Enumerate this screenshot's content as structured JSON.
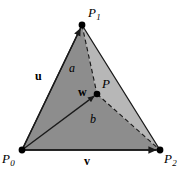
{
  "figure": {
    "background_color": "#ffffff",
    "line_color": "#1a1a1a",
    "fill_dark": "#8c8c8c",
    "fill_light": "#b4b4b4",
    "vertices": {
      "p0": {
        "label": "P",
        "subscript": "0",
        "x": 22,
        "y": 150
      },
      "p1": {
        "label": "P",
        "subscript": "1",
        "x": 82,
        "y": 25
      },
      "p2": {
        "label": "P",
        "subscript": "2",
        "x": 160,
        "y": 150
      },
      "p": {
        "label": "P",
        "x": 97,
        "y": 94
      }
    },
    "vectors": [
      {
        "name": "u",
        "label": "u",
        "from": "p0",
        "to": "p1",
        "style": "solid-arrow"
      },
      {
        "name": "v",
        "label": "v",
        "from": "p0",
        "to": "p2",
        "style": "solid-arrow"
      },
      {
        "name": "w",
        "label": "w",
        "from": "p0",
        "to": "p",
        "style": "solid-arrow"
      }
    ],
    "dashed_segments": [
      {
        "name": "p1-to-p",
        "from": "p1",
        "to": "p"
      },
      {
        "name": "p-to-p2",
        "from": "p",
        "to": "p2"
      }
    ],
    "region_labels": [
      {
        "name": "a",
        "label": "a",
        "x": 71,
        "y": 68
      },
      {
        "name": "b",
        "label": "b",
        "x": 92,
        "y": 118
      }
    ],
    "vector_labels": [
      {
        "name": "u",
        "label": "u",
        "x": 38,
        "y": 76
      },
      {
        "name": "v",
        "label": "v",
        "x": 87,
        "y": 156
      },
      {
        "name": "w",
        "label": "w",
        "x": 77,
        "y": 86
      }
    ]
  }
}
